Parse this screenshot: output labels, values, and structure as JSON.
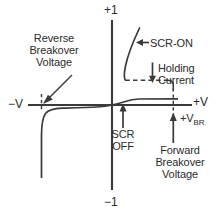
{
  "figure": {
    "kind": "scr-characteristic-curve",
    "title_visible": false,
    "background_color": "#ffffff",
    "line_color": "#3a3a3a",
    "text_color": "#2b2b2b"
  },
  "axes": {
    "y_positive_label": "+1",
    "y_negative_label": "−1",
    "x_negative_label": "−V",
    "x_positive_label": "+V",
    "origin_px": {
      "x": 112,
      "y": 105
    }
  },
  "annotations": {
    "reverse_breakover": "Reverse\nBreakover\nVoltage",
    "scr_on": "SCR-ON",
    "holding_current": "Holding\nCurrent",
    "scr_off": "SCR\nOFF",
    "forward_breakover": "Forward\nBreakover\nVoltage",
    "breakover_voltage_symbol": "+V",
    "breakover_voltage_subscript": "BR"
  },
  "icons": {
    "scr_on_arrow": "arrow-left-icon",
    "holding_current_arrow": "arrow-down-icon",
    "scr_off_arrow": "arrow-up-icon",
    "forward_breakover_arrow": "arrow-up-icon",
    "reverse_breakover_arrow": "arrow-down-right-icon"
  },
  "chart_data": {
    "type": "line",
    "xlabel": "Voltage (V)",
    "ylabel": "Current (I)",
    "xlim": [
      -1,
      1
    ],
    "ylim": [
      -1,
      1
    ],
    "grid": false,
    "legend": null,
    "axis_ticks": {
      "y": [
        "+1",
        "−1"
      ],
      "x": [
        "−V",
        "+V"
      ]
    },
    "series": [
      {
        "name": "Reverse blocking / reverse breakdown",
        "description": "Small reverse leakage current, then sharp negative avalanche breakdown at the reverse breakover voltage",
        "points": [
          {
            "x": -0.89,
            "y": -0.78
          },
          {
            "x": -0.89,
            "y": -0.3
          },
          {
            "x": -0.88,
            "y": -0.13
          },
          {
            "x": -0.85,
            "y": -0.07
          },
          {
            "x": -0.79,
            "y": -0.045
          },
          {
            "x": -0.6,
            "y": -0.035
          },
          {
            "x": -0.35,
            "y": -0.03
          },
          {
            "x": -0.12,
            "y": -0.022
          },
          {
            "x": 0.0,
            "y": 0.0
          }
        ]
      },
      {
        "name": "Forward blocking (SCR OFF)",
        "description": "Forward leakage current, nearly flat from origin to the forward breakover voltage",
        "points": [
          {
            "x": 0.0,
            "y": 0.0
          },
          {
            "x": 0.1,
            "y": 0.02
          },
          {
            "x": 0.2,
            "y": 0.035
          },
          {
            "x": 0.33,
            "y": 0.042
          },
          {
            "x": 0.6,
            "y": 0.045
          },
          {
            "x": 0.95,
            "y": 0.046
          }
        ]
      },
      {
        "name": "SCR-ON (forward conduction)",
        "description": "After breakover the SCR latches on; voltage collapses to a low on-state value while current rises steeply",
        "points": [
          {
            "x": 0.32,
            "y": 0.88
          },
          {
            "x": 0.22,
            "y": 0.62
          },
          {
            "x": 0.17,
            "y": 0.42
          },
          {
            "x": 0.16,
            "y": 0.3
          },
          {
            "x": 0.17,
            "y": 0.24
          }
        ]
      },
      {
        "name": "Holding current level (dashed)",
        "description": "Dashed horizontal line marking the holding current, running from the on-state branch across to the breakover point",
        "dashed": true,
        "points": [
          {
            "x": 0.17,
            "y": 0.235
          },
          {
            "x": 0.9,
            "y": 0.235
          },
          {
            "x": 0.95,
            "y": 0.17
          }
        ]
      },
      {
        "name": "Forward breakover marker (dashed vertical)",
        "description": "Dashed vertical guide at the forward breakover voltage",
        "dashed": true,
        "points": [
          {
            "x": 0.96,
            "y": 0.23
          },
          {
            "x": 0.96,
            "y": -0.1
          }
        ]
      },
      {
        "name": "Reverse breakover marker (dashed vertical)",
        "description": "Short dashed vertical guide at the reverse breakover voltage",
        "dashed": true,
        "points": [
          {
            "x": -0.89,
            "y": 0.09
          },
          {
            "x": -0.89,
            "y": -0.07
          }
        ]
      }
    ],
    "callouts": [
      {
        "label": "Reverse Breakover Voltage",
        "points_to": {
          "x": -0.89,
          "y": 0.0
        }
      },
      {
        "label": "SCR-ON",
        "points_to": {
          "x": 0.26,
          "y": 0.73
        }
      },
      {
        "label": "Holding Current",
        "points_to": {
          "x": 0.56,
          "y": 0.235
        }
      },
      {
        "label": "SCR OFF",
        "points_to": {
          "x": 0.1,
          "y": 0.0
        }
      },
      {
        "label": "Forward Breakover Voltage",
        "points_to": {
          "x": 0.96,
          "y": 0.0
        }
      }
    ]
  }
}
